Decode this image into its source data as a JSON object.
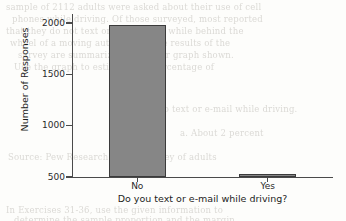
{
  "page": {
    "background_color": "#fdfdfb",
    "ghost_text_color": "#b9b6b0",
    "bleed_through_lines": [
      {
        "text": "sample of 2112 adults were asked about their use of cell",
        "x": 6,
        "y": 2
      },
      {
        "text": "phones while driving. Of those surveyed, most reported",
        "x": 12,
        "y": 14
      },
      {
        "text": "that they do not text or send e-mail while behind the",
        "x": 6,
        "y": 26
      },
      {
        "text": "wheel of a moving automobile. The results of the",
        "x": 10,
        "y": 38
      },
      {
        "text": "survey are summarized in the bar graph shown.",
        "x": 18,
        "y": 50
      },
      {
        "text": "Use the graph to estimate the percentage of",
        "x": 14,
        "y": 62
      },
      {
        "text": "adults who text or e-mail while driving.",
        "x": 120,
        "y": 104
      },
      {
        "text": "a. About 2 percent",
        "x": 180,
        "y": 128
      },
      {
        "text": "Source: Pew Research Center survey of adults",
        "x": 8,
        "y": 152
      },
      {
        "text": "In Exercises 31-36, use the given information to",
        "x": 6,
        "y": 205
      },
      {
        "text": "determine the sample proportion and the margin",
        "x": 14,
        "y": 215
      }
    ]
  },
  "chart_data": {
    "type": "bar",
    "title": "",
    "xlabel": "Do you text or e-mail while driving?",
    "ylabel": "Number of Responses",
    "categories": [
      "No",
      "Yes"
    ],
    "values": [
      1980,
      530
    ],
    "ylim": [
      500,
      2000
    ],
    "yticks": [
      500,
      1000,
      1500,
      2000
    ],
    "ytick_labels": [
      "500",
      "1000",
      "1500",
      "2000"
    ],
    "grid": false,
    "legend": "none",
    "bar_fill_color": "#868686",
    "bar_edge_color": "#3b3b3b",
    "axis_color": "#4a4a4a"
  }
}
